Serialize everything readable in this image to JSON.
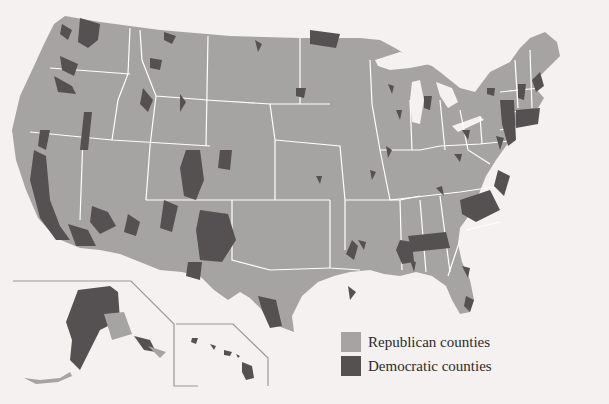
{
  "map": {
    "title": "",
    "subject": "United States presidential election results by county",
    "colors": {
      "background": "#f4f1f0",
      "republican": "#a6a3a3",
      "democratic": "#555152",
      "state_borders": "#ffffff",
      "inset_lines": "#9a9898"
    },
    "insets": [
      "Alaska",
      "Hawaii"
    ]
  },
  "legend": {
    "items": [
      {
        "label": "Republican counties",
        "color": "#a6a3a3"
      },
      {
        "label": "Democratic counties",
        "color": "#555152"
      }
    ]
  }
}
